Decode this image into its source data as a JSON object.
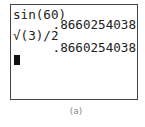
{
  "calculator_screen": {
    "lines": [
      {
        "text": "sin(60)",
        "align": "left"
      },
      {
        "text": ".8660254038",
        "align": "right"
      },
      {
        "text": "√(3)/2",
        "align": "left"
      },
      {
        "text": ".8660254038",
        "align": "right"
      }
    ],
    "cursor": "block-cursor"
  },
  "caption": "(a)"
}
